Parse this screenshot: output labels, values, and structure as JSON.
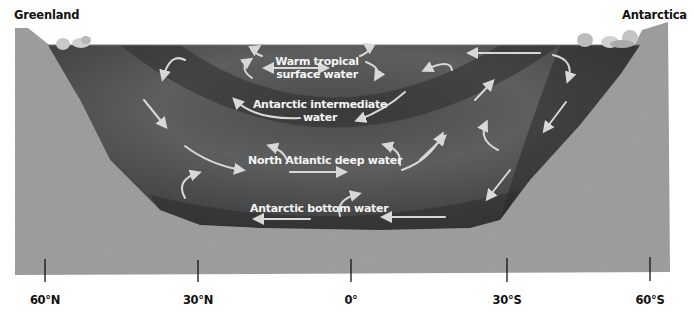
{
  "diagram": {
    "places": {
      "left": "Greenland",
      "right": "Antarctica"
    },
    "water_masses": [
      {
        "name": "warm-tropical-surface-water",
        "label_line1": "Warm tropical",
        "label_line2": "surface water"
      },
      {
        "name": "antarctic-intermediate-water",
        "label_line1": "Antarctic intermediate",
        "label_line2": "water"
      },
      {
        "name": "north-atlantic-deep-water",
        "label_line1": "North Atlantic deep water",
        "label_line2": ""
      },
      {
        "name": "antarctic-bottom-water",
        "label_line1": "Antarctic bottom water",
        "label_line2": ""
      }
    ],
    "latitude_ticks": [
      {
        "label": "60°N",
        "x": 45
      },
      {
        "label": "30°N",
        "x": 198
      },
      {
        "label": "0°",
        "x": 351
      },
      {
        "label": "30°S",
        "x": 507
      },
      {
        "label": "60°S",
        "x": 650
      }
    ],
    "colors": {
      "land": "#9a9a9a",
      "water_dark": "#3c3c3c",
      "water_mid": "#6a6a6a",
      "arrow": "#d8d8d8",
      "ice": "#cfcfcf",
      "text_dark": "#111111",
      "text_light": "#f4f4f4"
    }
  }
}
